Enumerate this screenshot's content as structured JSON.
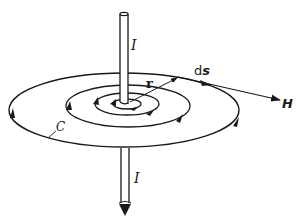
{
  "diagram": {
    "labels": {
      "current_top": "I",
      "current_bottom": "I",
      "radius": "r",
      "line_element_d": "d",
      "line_element_s": "s",
      "field": "H",
      "contour": "C"
    },
    "colors": {
      "stroke": "#1a1a1a",
      "background": "#ffffff"
    },
    "elements": [
      {
        "name": "wire",
        "description": "vertical conductor passing through concentric field circles"
      },
      {
        "name": "field-lines",
        "count": 4,
        "description": "concentric elliptical field lines with direction arrows"
      },
      {
        "name": "radius-vector",
        "label": "r"
      },
      {
        "name": "tangent-vector",
        "labels": [
          "ds",
          "H"
        ]
      }
    ]
  }
}
